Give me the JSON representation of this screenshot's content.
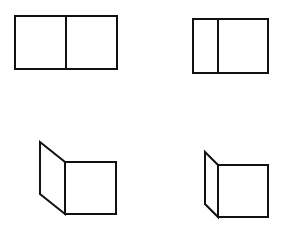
{
  "diagram": {
    "background": "#ffffff",
    "stroke_color": "#111111",
    "stroke_width": 2,
    "figures": [
      {
        "id": "flat-equal-panels",
        "description": "Flat two-panel rectangle with equal halves",
        "outer": {
          "x": 15,
          "y": 16,
          "w": 102,
          "h": 53
        },
        "divider_x": 66
      },
      {
        "id": "flat-narrow-left-panel",
        "description": "Flat two-panel rectangle with narrow left panel",
        "outer": {
          "x": 193,
          "y": 19,
          "w": 75,
          "h": 54
        },
        "divider_x": 218
      },
      {
        "id": "folded-wide-left-panel",
        "description": "Folded view: left panel angled back, square right panel",
        "left_panel_points": "40,142 65,162 65,214 40,194",
        "right_panel": {
          "x": 65,
          "y": 162,
          "w": 51,
          "h": 52
        }
      },
      {
        "id": "folded-narrow-left-panel",
        "description": "Folded view: narrow left panel angled back, square right panel",
        "left_panel_points": "205,152 218,165 218,217 205,204",
        "right_panel": {
          "x": 218,
          "y": 165,
          "w": 50,
          "h": 52
        }
      }
    ]
  }
}
